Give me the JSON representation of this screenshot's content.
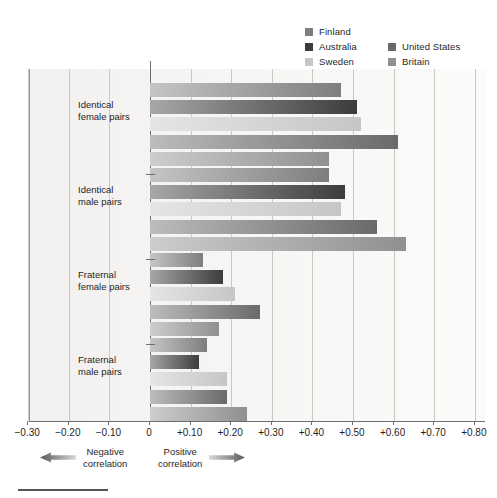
{
  "chart_data": {
    "type": "bar",
    "orientation": "horizontal",
    "title": "",
    "xlabel": "",
    "ylabel": "",
    "xlim": [
      -0.3,
      0.8
    ],
    "grid": true,
    "legend_position": "top-right",
    "categories": [
      "Identical\nfemale pairs",
      "Identical\nmale pairs",
      "Fraternal\nfemale pairs",
      "Fraternal\nmale pairs"
    ],
    "tick_labels": [
      "−0.30",
      "−0.20",
      "−0.10",
      "0",
      "+0.10",
      "+0.20",
      "+0.30",
      "+0.40",
      "+0.50",
      "+0.60",
      "+0.70",
      "+0.80"
    ],
    "tick_values": [
      -0.3,
      -0.2,
      -0.1,
      0,
      0.1,
      0.2,
      0.3,
      0.4,
      0.5,
      0.6,
      0.7,
      0.8
    ],
    "series": [
      {
        "name": "Finland",
        "color": "#7e7e7e",
        "values": [
          0.47,
          0.44,
          0.13,
          0.14
        ]
      },
      {
        "name": "Australia",
        "color": "#3c3c3c",
        "values": [
          0.51,
          0.48,
          0.18,
          0.12
        ]
      },
      {
        "name": "Sweden",
        "color": "#c6c6c6",
        "values": [
          0.52,
          0.47,
          0.21,
          0.19
        ]
      },
      {
        "name": "United States",
        "color": "#6a6a6a",
        "values": [
          0.61,
          0.56,
          0.27,
          0.19
        ]
      },
      {
        "name": "Britain",
        "color": "#909090",
        "values": [
          0.44,
          0.63,
          0.17,
          0.24
        ]
      }
    ],
    "annotations": [
      {
        "id": "negative",
        "text": "Negative\ncorrelation",
        "arrow": "left-arrow-icon"
      },
      {
        "id": "positive",
        "text": "Positive\ncorrelation",
        "arrow": "right-arrow-icon"
      }
    ]
  },
  "legend": {
    "column1": [
      "Finland",
      "Australia",
      "Sweden"
    ],
    "column2": [
      "United States",
      "Britain"
    ]
  }
}
